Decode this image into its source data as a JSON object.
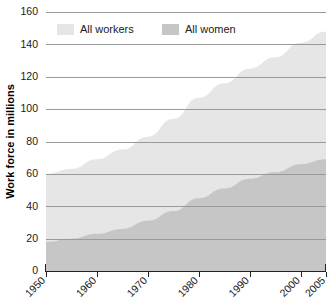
{
  "chart_data": {
    "type": "area",
    "title": "",
    "subtitle": "",
    "xlabel": "",
    "ylabel": "Work force in millions",
    "xlim": [
      1950,
      2005
    ],
    "ylim": [
      0,
      160
    ],
    "grid": true,
    "legend_position": "top-inside",
    "ytick_labels": [
      "0",
      "20",
      "40",
      "60",
      "80",
      "100",
      "120",
      "140",
      "160"
    ],
    "ytick_values": [
      0,
      20,
      40,
      60,
      80,
      100,
      120,
      140,
      160
    ],
    "xtick_labels": [
      "1950",
      "1960",
      "1970",
      "1980",
      "1990",
      "2000",
      "2005"
    ],
    "xtick_values": [
      1950,
      1960,
      1970,
      1980,
      1990,
      2000,
      2005
    ],
    "x": [
      1950,
      1955,
      1960,
      1965,
      1970,
      1975,
      1980,
      1985,
      1990,
      1995,
      2000,
      2005
    ],
    "series": [
      {
        "name": "All workers",
        "color": "#e6e6e6",
        "values": [
          60,
          63,
          69,
          75,
          83,
          94,
          107,
          116,
          125,
          132,
          141,
          148
        ]
      },
      {
        "name": "All women",
        "color": "#c6c6c6",
        "values": [
          18,
          20,
          23,
          26,
          31,
          37,
          45,
          51,
          57,
          61,
          66,
          69
        ]
      }
    ],
    "legend": [
      {
        "label": "All workers",
        "color": "#e6e6e6"
      },
      {
        "label": "All women",
        "color": "#c6c6c6"
      }
    ]
  },
  "axis": {
    "y_title": "Work force in millions"
  }
}
